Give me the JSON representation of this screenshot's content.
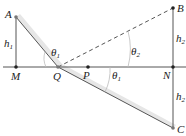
{
  "diagram": {
    "points": {
      "A": {
        "label": "A",
        "x": 16,
        "y": 17
      },
      "B": {
        "label": "B",
        "x": 173,
        "y": 8
      },
      "C": {
        "label": "C",
        "x": 173,
        "y": 128
      },
      "M": {
        "label": "M",
        "x": 16,
        "y": 67
      },
      "N": {
        "label": "N",
        "x": 173,
        "y": 67
      },
      "P": {
        "label": "P",
        "x": 88,
        "y": 67
      },
      "Q": {
        "label": "Q",
        "x": 58,
        "y": 67
      }
    },
    "heights": {
      "h1": {
        "base": "h",
        "sub": "1"
      },
      "h2_upper": {
        "base": "h",
        "sub": "2"
      },
      "h2_lower": {
        "base": "h",
        "sub": "2"
      }
    },
    "angles": {
      "theta1_upper": {
        "base": "θ",
        "sub": "1"
      },
      "theta2": {
        "base": "θ",
        "sub": "2"
      },
      "theta1_lower": {
        "base": "θ",
        "sub": "1"
      }
    },
    "colors": {
      "line": "#555555",
      "light_band": "#d9d9d9",
      "point": "#222222"
    }
  }
}
